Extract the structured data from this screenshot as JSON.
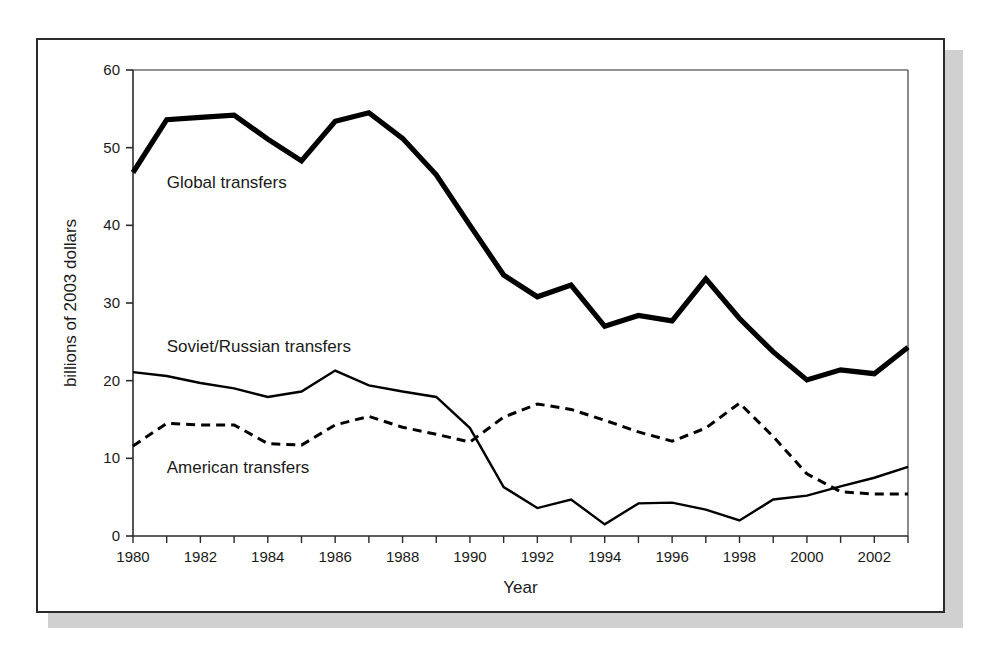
{
  "figure": {
    "background_color": "#ffffff",
    "frame_color": "#2b2b2b",
    "shadow_color": "#d0d0d0"
  },
  "chart_data": {
    "type": "line",
    "title": "",
    "xlabel": "Year",
    "ylabel": "billions of 2003 dollars",
    "xlim": [
      1980,
      2003
    ],
    "ylim": [
      0,
      60
    ],
    "yticks": [
      0,
      10,
      20,
      30,
      40,
      50,
      60
    ],
    "ytick_labels": [
      "0",
      "10",
      "20",
      "30",
      "40",
      "50",
      "60"
    ],
    "xticks": [
      1980,
      1981,
      1982,
      1983,
      1984,
      1985,
      1986,
      1987,
      1988,
      1989,
      1990,
      1991,
      1992,
      1993,
      1994,
      1995,
      1996,
      1997,
      1998,
      1999,
      2000,
      2001,
      2002,
      2003
    ],
    "xtick_labels": [
      "1980",
      "",
      "1982",
      "",
      "1984",
      "",
      "1986",
      "",
      "1988",
      "",
      "1990",
      "",
      "1992",
      "",
      "1994",
      "",
      "1996",
      "",
      "1998",
      "",
      "2000",
      "",
      "2002",
      ""
    ],
    "grid": false,
    "legend_position": "inline-annotations",
    "x": [
      1980,
      1981,
      1982,
      1983,
      1984,
      1985,
      1986,
      1987,
      1988,
      1989,
      1990,
      1991,
      1992,
      1993,
      1994,
      1995,
      1996,
      1997,
      1998,
      1999,
      2000,
      2001,
      2002,
      2003
    ],
    "series": [
      {
        "name": "Global transfers",
        "style": "solid-thick",
        "color": "#000000",
        "label_x": 1981.0,
        "label_y": 44.8,
        "values": [
          46.8,
          53.6,
          53.9,
          54.2,
          51.1,
          48.3,
          53.4,
          54.5,
          51.2,
          46.5,
          40.0,
          33.6,
          30.8,
          32.3,
          27.0,
          28.4,
          27.7,
          33.1,
          28.0,
          23.7,
          20.1,
          21.4,
          20.9,
          24.3
        ]
      },
      {
        "name": "Soviet/Russian transfers",
        "style": "solid-thin",
        "color": "#000000",
        "label_x": 1981.0,
        "label_y": 23.7,
        "values": [
          21.1,
          20.6,
          19.7,
          19.0,
          17.9,
          18.6,
          21.3,
          19.4,
          18.6,
          17.9,
          13.9,
          6.3,
          3.6,
          4.7,
          1.5,
          4.2,
          4.3,
          3.4,
          2.0,
          4.7,
          5.2,
          6.4,
          7.5,
          8.9
        ]
      },
      {
        "name": "American transfers",
        "style": "dashed",
        "color": "#000000",
        "label_x": 1981.0,
        "label_y": 8.1,
        "values": [
          11.6,
          14.5,
          14.3,
          14.3,
          11.9,
          11.7,
          14.3,
          15.4,
          14.0,
          13.1,
          12.1,
          15.3,
          17.0,
          16.3,
          14.9,
          13.4,
          12.2,
          13.9,
          17.1,
          12.8,
          8.0,
          5.7,
          5.4,
          5.4
        ]
      }
    ]
  }
}
